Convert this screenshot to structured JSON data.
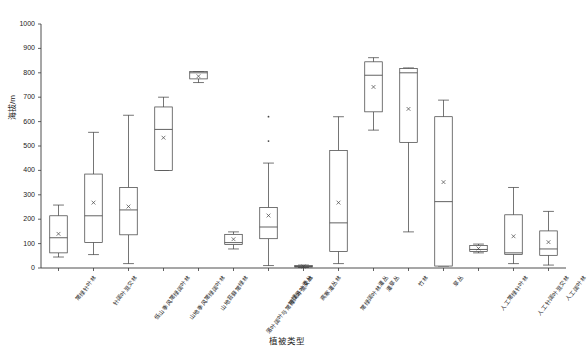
{
  "chart_data": {
    "type": "box",
    "title": "",
    "xlabel": "植被类型",
    "ylabel": "海拔/m",
    "ylim": [
      0,
      1000
    ],
    "ytick_labels": [
      "0",
      "100",
      "200",
      "300",
      "400",
      "500",
      "600",
      "700",
      "800",
      "900",
      "1000"
    ],
    "ytick_values": [
      0,
      100,
      200,
      300,
      400,
      500,
      600,
      700,
      800,
      900,
      1000
    ],
    "grid": false,
    "legend": "none",
    "mean_marker": "x",
    "categories": [
      "常绿针叶林",
      "针阔叶混交林",
      "低山季风常绿阔叶林",
      "山地季风常绿阔叶林",
      "山地苔藓常绿林",
      "落叶阔叶与常绿阔叶混交林",
      "常绿落叶灌丛",
      "高寒灌丛林",
      "常绿阔叶林灌丛",
      "灌草丛",
      "竹林",
      "草丛",
      "人工常绿针叶林",
      "人工针阔叶混交林",
      "人工阔叶林"
    ],
    "boxes": [
      {
        "category": "常绿针叶林",
        "whisker_low": 45,
        "q1": 62,
        "median": 124,
        "mean": 140,
        "q3": 214,
        "whisker_high": 258,
        "outliers": []
      },
      {
        "category": "针阔叶混交林",
        "whisker_low": 55,
        "q1": 105,
        "median": 214,
        "mean": 268,
        "q3": 385,
        "whisker_high": 556,
        "outliers": []
      },
      {
        "category": "低山季风常绿阔叶林",
        "whisker_low": 18,
        "q1": 136,
        "median": 238,
        "mean": 252,
        "q3": 330,
        "whisker_high": 626,
        "outliers": []
      },
      {
        "category": "山地季风常绿阔叶林",
        "whisker_low": 400,
        "q1": 400,
        "median": 568,
        "mean": 534,
        "q3": 660,
        "whisker_high": 700,
        "outliers": []
      },
      {
        "category": "山地苔藓常绿林",
        "whisker_low": 760,
        "q1": 775,
        "median": 800,
        "mean": 786,
        "q3": 805,
        "whisker_high": 805,
        "outliers": []
      },
      {
        "category": "落叶阔叶与常绿阔叶混交林",
        "whisker_low": 78,
        "q1": 96,
        "median": 104,
        "mean": 118,
        "q3": 138,
        "whisker_high": 148,
        "outliers": []
      },
      {
        "category": "常绿落叶灌丛",
        "whisker_low": 10,
        "q1": 120,
        "median": 168,
        "mean": 215,
        "q3": 248,
        "whisker_high": 430,
        "outliers": [
          520,
          620
        ]
      },
      {
        "category": "高寒灌丛林",
        "whisker_low": 2,
        "q1": 4,
        "median": 6,
        "mean": 6,
        "q3": 10,
        "whisker_high": 12,
        "outliers": []
      },
      {
        "category": "常绿阔叶林灌丛",
        "whisker_low": 18,
        "q1": 68,
        "median": 185,
        "mean": 268,
        "q3": 482,
        "whisker_high": 620,
        "outliers": []
      },
      {
        "category": "灌草丛",
        "whisker_low": 565,
        "q1": 640,
        "median": 790,
        "mean": 742,
        "q3": 845,
        "whisker_high": 862,
        "outliers": []
      },
      {
        "category": "竹林",
        "whisker_low": 148,
        "q1": 515,
        "median": 800,
        "mean": 652,
        "q3": 818,
        "whisker_high": 820,
        "outliers": []
      },
      {
        "category": "草丛",
        "whisker_low": 8,
        "q1": 8,
        "median": 272,
        "mean": 352,
        "q3": 620,
        "whisker_high": 688,
        "outliers": []
      },
      {
        "category": "人工常绿针叶林",
        "whisker_low": 62,
        "q1": 68,
        "median": 76,
        "mean": 80,
        "q3": 92,
        "whisker_high": 98,
        "outliers": []
      },
      {
        "category": "人工针阔叶混交林",
        "whisker_low": 18,
        "q1": 56,
        "median": 62,
        "mean": 130,
        "q3": 218,
        "whisker_high": 330,
        "outliers": []
      },
      {
        "category": "人工阔叶林",
        "whisker_low": 12,
        "q1": 52,
        "median": 78,
        "mean": 106,
        "q3": 152,
        "whisker_high": 232,
        "outliers": []
      }
    ]
  }
}
